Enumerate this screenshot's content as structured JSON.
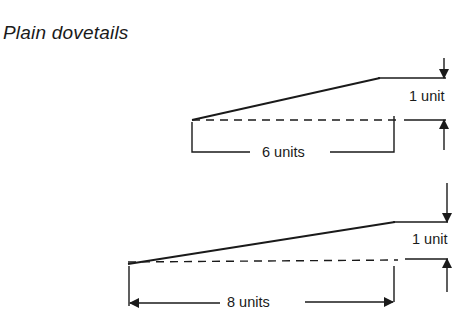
{
  "title": "Plain dovetails",
  "figures": [
    {
      "name": "ratio-1-in-6",
      "rise_label": "1 unit",
      "run_label": "6 units",
      "rise": 1,
      "run": 6
    },
    {
      "name": "ratio-1-in-8",
      "rise_label": "1 unit",
      "run_label": "8 units",
      "rise": 1,
      "run": 8
    }
  ],
  "colors": {
    "ink": "#1a1a1a",
    "background": "#ffffff"
  }
}
